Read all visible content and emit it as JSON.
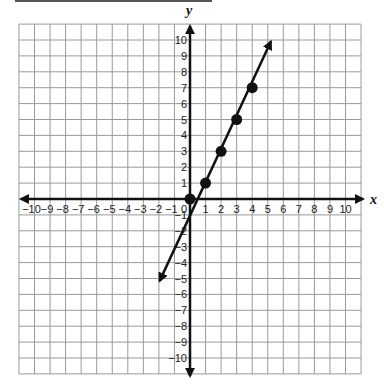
{
  "chart_data": {
    "type": "line",
    "title": "",
    "xlabel": "x",
    "ylabel": "y",
    "xlim": [
      -11,
      11
    ],
    "ylim": [
      -11,
      11
    ],
    "grid": true,
    "x_ticks": [
      -10,
      -9,
      -8,
      -7,
      -6,
      -5,
      -4,
      -3,
      -2,
      -1,
      1,
      2,
      3,
      4,
      5,
      6,
      7,
      8,
      9,
      10
    ],
    "y_ticks": [
      -10,
      -9,
      -8,
      -7,
      -6,
      -5,
      -4,
      -3,
      -2,
      -1,
      1,
      2,
      3,
      4,
      5,
      6,
      7,
      8,
      9,
      10
    ],
    "origin_label": "0",
    "series": [
      {
        "name": "y = 2x - 1 (plotted points)",
        "points": [
          [
            0,
            0
          ],
          [
            1,
            1
          ],
          [
            2,
            3
          ],
          [
            3,
            5
          ],
          [
            4,
            7
          ]
        ]
      }
    ],
    "line": {
      "from": [
        -1.95,
        -5.15
      ],
      "to": [
        5.2,
        9.9
      ],
      "arrows": "both"
    }
  },
  "colors": {
    "grid": "#9a9a9a",
    "axis": "#111111",
    "line": "#111111",
    "point": "#111111"
  }
}
